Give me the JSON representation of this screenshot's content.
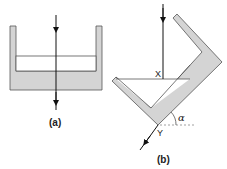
{
  "figure": {
    "panel_a": {
      "caption": "(a)",
      "description": "Upright open container with liquid; vertical ray passing straight through"
    },
    "panel_b": {
      "caption": "(b)",
      "point_x_label": "X",
      "point_y_label": "Y",
      "angle_label": "α",
      "description": "Tilted container with liquid; vertical ray enters at X, refracted exit at Y, angle α to horizontal"
    },
    "colors": {
      "fill": "#d4d4d4",
      "stroke": "#555555",
      "ray": "#111111",
      "dashed": "#888888"
    }
  }
}
